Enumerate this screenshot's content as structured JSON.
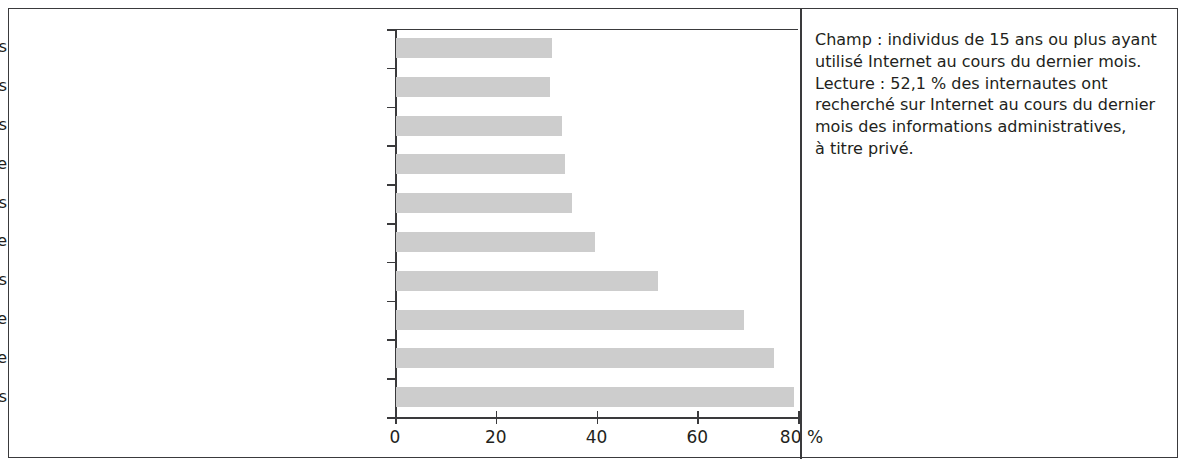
{
  "chart_data": {
    "type": "bar",
    "orientation": "horizontal",
    "title": "",
    "xlabel": "%",
    "ylabel": "",
    "xlim": [
      0,
      80
    ],
    "grid": false,
    "legend": null,
    "bar_color": "#cdcdcd",
    "axis_color": "#3a3a3c",
    "categories": [
      "Télécharger documents administratifs",
      "Musiques, films",
      "Organisation de vacances",
      "Messagerie instantanée",
      "Achat de biens et services",
      "Compte bancaire",
      "Obtenir des informations administratives",
      "Recherche documentaire",
      "Messagerie électronique",
      "Recherche d'informations"
    ],
    "values": [
      31.0,
      30.5,
      33.0,
      33.5,
      35.0,
      39.5,
      52.1,
      69.0,
      75.0,
      79.0
    ],
    "xticks": [
      0,
      20,
      40,
      60,
      80
    ],
    "xticklabels": [
      "0",
      "20",
      "40",
      "60",
      "80 %"
    ]
  },
  "notes": {
    "text": "Champ : individus de 15 ans ou plus ayant utilisé Internet au cours du dernier mois.\nLecture : 52,1 % des internautes ont recherché sur Internet au cours du dernier mois des informations administratives,\nà titre privé."
  }
}
